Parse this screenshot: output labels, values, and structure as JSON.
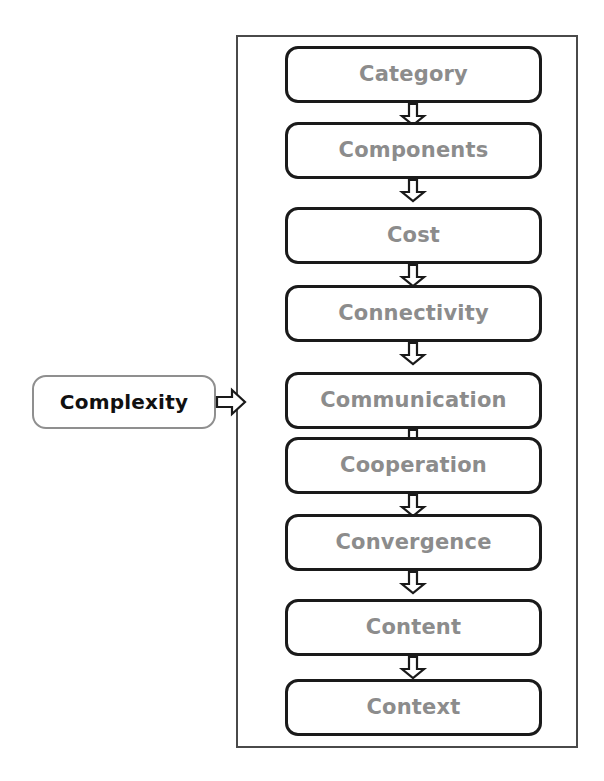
{
  "diagram": {
    "type": "flowchart",
    "orientation": "vertical-chain-with-left-source",
    "colors": {
      "chain_box_border": "#1a1a1a",
      "chain_label_text": "#8c8c8c",
      "source_box_border": "#8f8f8f",
      "source_label_text": "#111111",
      "frame_border": "#4a4a4a",
      "arrow_stroke": "#1a1a1a",
      "background": "#ffffff"
    },
    "source": {
      "label": "Complexity",
      "icon": "rounded-rect-node"
    },
    "connector": {
      "from": "Complexity",
      "to": "Category",
      "icon": "block-arrow-right-icon"
    },
    "chain": [
      {
        "label": "Category"
      },
      {
        "label": "Components"
      },
      {
        "label": "Cost"
      },
      {
        "label": "Connectivity"
      },
      {
        "label": "Communication"
      },
      {
        "label": "Cooperation"
      },
      {
        "label": "Convergence"
      },
      {
        "label": "Content"
      },
      {
        "label": "Context"
      }
    ],
    "chain_arrow_icon": "block-arrow-down-icon"
  }
}
